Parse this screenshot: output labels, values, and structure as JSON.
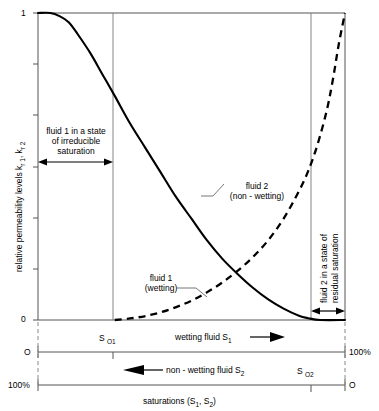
{
  "chart_data": {
    "type": "line",
    "title": "",
    "xlabel": "saturations  (S1, S2)",
    "ylabel": "relative permeability levels k r1, k r2",
    "xlim": [
      0,
      1
    ],
    "ylim": [
      0,
      1
    ],
    "grid": false,
    "legend_position": "inline-annotations",
    "y_ticks": [
      "1",
      "0"
    ],
    "y_tick_values": [
      1,
      0
    ],
    "y_minor_tick_count": 5,
    "x_axis_top": {
      "left_label": "O",
      "right_label": "100%",
      "tick_label": "S O1",
      "tick_value": 0.25,
      "direction_label": "wetting fluid S1",
      "direction": "right"
    },
    "x_axis_bottom": {
      "left_label": "100%",
      "right_label": "O",
      "tick_label": "S O2",
      "tick_value": 0.895,
      "direction_label": "non - wetting fluid S2",
      "direction": "left"
    },
    "series": [
      {
        "name": "fluid 2 (non - wetting)",
        "style": "solid",
        "annotation_line1": "fluid 2",
        "annotation_line2": "(non - wetting)",
        "x": [
          0.0,
          0.04,
          0.07,
          0.1,
          0.13,
          0.17,
          0.21,
          0.25,
          0.3,
          0.35,
          0.4,
          0.45,
          0.5,
          0.55,
          0.6,
          0.65,
          0.7,
          0.75,
          0.8,
          0.85,
          0.88,
          0.92,
          1.0
        ],
        "y": [
          1.0,
          1.0,
          0.99,
          0.97,
          0.93,
          0.87,
          0.8,
          0.73,
          0.64,
          0.56,
          0.48,
          0.4,
          0.33,
          0.26,
          0.2,
          0.15,
          0.105,
          0.067,
          0.037,
          0.014,
          0.006,
          0.0,
          0.0
        ]
      },
      {
        "name": "fluid 1 (wetting)",
        "style": "dashed",
        "annotation_line1": "fluid 1",
        "annotation_line2": "(wetting)",
        "x": [
          0.25,
          0.3,
          0.35,
          0.4,
          0.45,
          0.5,
          0.55,
          0.6,
          0.65,
          0.7,
          0.75,
          0.8,
          0.85,
          0.88,
          0.91,
          0.94,
          0.96,
          0.98,
          1.0
        ],
        "y": [
          0.0,
          0.005,
          0.013,
          0.025,
          0.042,
          0.063,
          0.09,
          0.122,
          0.16,
          0.205,
          0.26,
          0.33,
          0.42,
          0.485,
          0.57,
          0.68,
          0.78,
          0.9,
          1.0
        ]
      }
    ],
    "annotations": [
      {
        "name": "irreducible-saturation",
        "lines": [
          "fluid 1 in a state",
          "of irreducible",
          "saturation"
        ],
        "span_from": 0.0,
        "span_to": 0.25,
        "arrow": "double"
      },
      {
        "name": "residual-saturation",
        "lines": [
          "fluid 2 in a state of",
          "residual saturation"
        ],
        "span_from": 0.895,
        "span_to": 1.0,
        "arrow": "double",
        "orientation": "vertical"
      }
    ]
  }
}
